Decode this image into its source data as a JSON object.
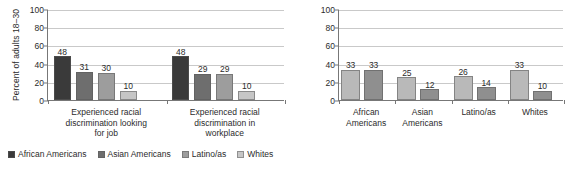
{
  "figure": {
    "background": "#ffffff",
    "axis_color": "#777777",
    "grid_color": "#c9c9c9",
    "text_color": "#2b2b2b"
  },
  "chart_data": [
    {
      "id": "left",
      "type": "bar",
      "title": "",
      "xlabel": "",
      "ylabel": "Percent of adults 18–30",
      "ylim": [
        0,
        100
      ],
      "yticks": [
        0,
        20,
        40,
        60,
        80,
        100
      ],
      "ytick_labels": [
        "0",
        "20",
        "40",
        "60",
        "80",
        "100"
      ],
      "grid": true,
      "legend_position": "bottom-left",
      "categories": [
        "Experienced racial discrimination looking for job",
        "Experienced racial discrimination in workplace"
      ],
      "category_lines": [
        [
          "Experienced racial",
          "discrimination looking",
          "for job"
        ],
        [
          "Experienced racial",
          "discrimination in",
          "workplace"
        ]
      ],
      "series": [
        {
          "name": "African Americans",
          "color": "#3a3a3a",
          "values": [
            48,
            48
          ]
        },
        {
          "name": "Asian Americans",
          "color": "#6e6e6e",
          "values": [
            31,
            29
          ]
        },
        {
          "name": "Latino/as",
          "color": "#9d9d9d",
          "values": [
            30,
            29
          ]
        },
        {
          "name": "Whites",
          "color": "#c6c6c6",
          "values": [
            10,
            10
          ]
        }
      ]
    },
    {
      "id": "right",
      "type": "bar",
      "title": "",
      "xlabel": "",
      "ylabel": "Percent of adults 18–30",
      "ylim": [
        0,
        100
      ],
      "yticks": [
        0,
        20,
        40,
        60,
        80,
        100
      ],
      "ytick_labels": [
        "0",
        "20",
        "40",
        "60",
        "80",
        "100"
      ],
      "grid": true,
      "legend_position": "bottom-center",
      "categories": [
        "African Americans",
        "Asian Americans",
        "Latino/as",
        "Whites"
      ],
      "category_lines": [
        [
          "African",
          "Americans"
        ],
        [
          "Asian",
          "Americans"
        ],
        [
          "Latino/as"
        ],
        [
          "Whites"
        ]
      ],
      "series": [
        {
          "name": "Women",
          "color": "#b9b9b9",
          "values": [
            33,
            25,
            26,
            33
          ]
        },
        {
          "name": "Men",
          "color": "#8f8f8f",
          "values": [
            33,
            12,
            14,
            10
          ]
        }
      ]
    }
  ]
}
